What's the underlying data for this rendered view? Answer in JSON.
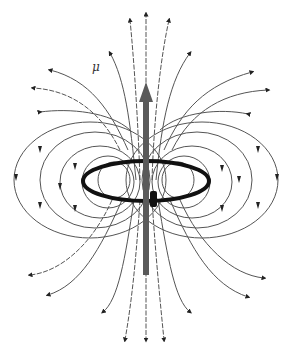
{
  "diagram": {
    "labels": {
      "moment": "μ"
    },
    "elements": {
      "current_loop": "ring",
      "moment_arrow": "upward",
      "field_lines": "closed loops around ring"
    },
    "colors": {
      "field_line": "#555555",
      "ring": "#111111",
      "moment_arrow": "#5a5a5a",
      "background": "#ffffff"
    }
  }
}
